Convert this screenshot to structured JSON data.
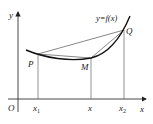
{
  "diagram": {
    "axes": {
      "x_label": "x",
      "y_label": "y",
      "origin_label": "O"
    },
    "curve_label": "y=f(x)",
    "points": {
      "P": {
        "label": "P"
      },
      "M": {
        "label": "M"
      },
      "Q": {
        "label": "Q"
      }
    },
    "ticks": {
      "x1": {
        "base": "x",
        "sub": "1"
      },
      "x": {
        "base": "x",
        "sub": ""
      },
      "x2": {
        "base": "x",
        "sub": "2"
      }
    },
    "colors": {
      "line": "#222222",
      "curve": "#111111",
      "thin": "#666666"
    }
  }
}
